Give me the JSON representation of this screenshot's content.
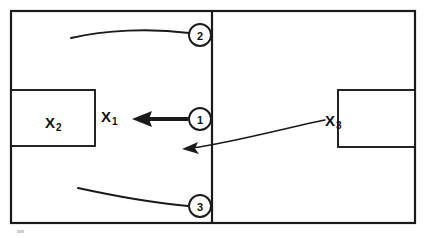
{
  "diagram": {
    "colors": {
      "stroke": "#1a1a1a",
      "background": "#ffffff",
      "text": "#111111"
    },
    "frame": {
      "name": "outer-frame",
      "x": 11,
      "y": 11,
      "width": 404,
      "height": 212
    },
    "divider": {
      "name": "vertical-divider",
      "x": 212,
      "y1": 11,
      "y2": 223
    },
    "boxes": [
      {
        "id": "x2",
        "label_base": "X",
        "label_sub": "2",
        "x": 11,
        "y": 90,
        "width": 84,
        "height": 56,
        "label_x": 53,
        "label_y": 124
      },
      {
        "id": "x3",
        "label_base": "X",
        "label_sub": "3",
        "x": 338,
        "y": 90,
        "width": 77,
        "height": 57,
        "label_x": 330,
        "label_y": 124
      }
    ],
    "free_labels": [
      {
        "id": "x1",
        "label_base": "X",
        "label_sub": "1",
        "x": 104,
        "y": 122
      }
    ],
    "callouts": [
      {
        "number": "2",
        "cx": 200,
        "cy": 35,
        "r": 11,
        "leader": "M 71,38 C 105,30 150,28 189,33"
      },
      {
        "number": "1",
        "cx": 200,
        "cy": 119,
        "r": 11,
        "leader": "M 188,119 L 143,119"
      },
      {
        "number": "3",
        "cx": 200,
        "cy": 206,
        "r": 11,
        "leader": "M 78,188 C 110,195 155,203 188,206"
      }
    ],
    "arrows": [
      {
        "id": "arrow-to-x1",
        "style": "bold",
        "path": "M 188,119 L 143,119",
        "head_at": "left"
      },
      {
        "id": "arrow-from-x3",
        "style": "thin",
        "path": "M 325,120 C 285,128 235,142 187,148",
        "head_at": "left"
      }
    ],
    "artifacts": [
      {
        "id": "scan-smudge",
        "x": 17,
        "y": 230,
        "width": 7,
        "height": 3
      }
    ]
  }
}
